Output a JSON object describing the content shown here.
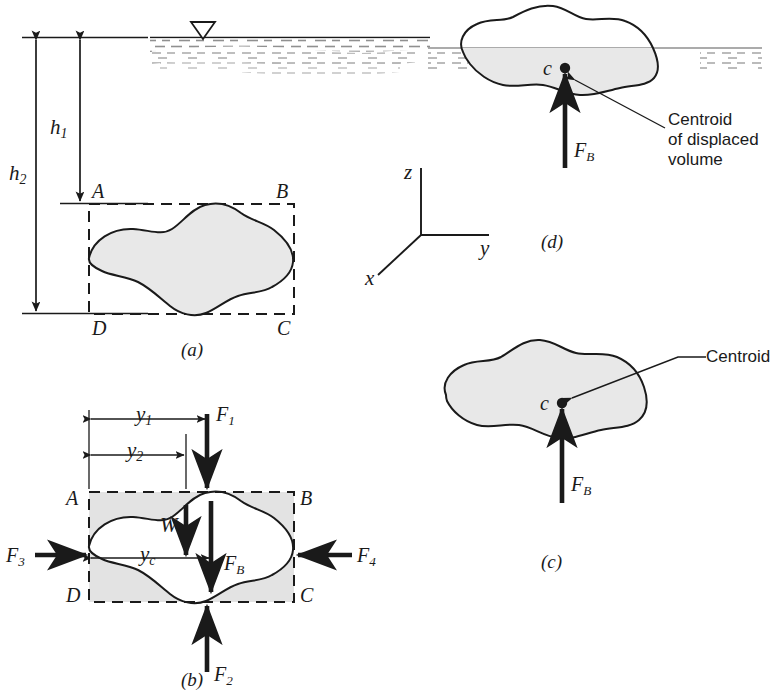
{
  "figure": {
    "colors": {
      "line": "#1a1a1a",
      "body_fill": "#e8e8e8",
      "shade_fill": "#e3e3e3",
      "water_hatch": "#7a7a7a",
      "white": "#ffffff"
    }
  },
  "panels": {
    "a": {
      "caption": "(a)",
      "corner_labels": {
        "A": "A",
        "B": "B",
        "C": "C",
        "D": "D"
      },
      "dimensions": [
        {
          "name": "h1",
          "base": "h",
          "sub": "1"
        },
        {
          "name": "h2",
          "base": "h",
          "sub": "2"
        }
      ],
      "free_surface_marker": "free-surface-triangle"
    },
    "b": {
      "caption": "(b)",
      "corner_labels": {
        "A": "A",
        "B": "B",
        "C": "C",
        "D": "D"
      },
      "dimensions": [
        {
          "name": "y1",
          "base": "y",
          "sub": "1"
        },
        {
          "name": "y2",
          "base": "y",
          "sub": "2"
        },
        {
          "name": "yc",
          "base": "y",
          "sub": "c"
        }
      ],
      "forces": [
        {
          "name": "F1",
          "base": "F",
          "sub": "1",
          "direction": "down"
        },
        {
          "name": "F2",
          "base": "F",
          "sub": "2",
          "direction": "up"
        },
        {
          "name": "F3",
          "base": "F",
          "sub": "3",
          "direction": "right"
        },
        {
          "name": "F4",
          "base": "F",
          "sub": "4",
          "direction": "left"
        },
        {
          "name": "FB",
          "base": "F",
          "sub": "B",
          "direction": "down"
        },
        {
          "name": "W",
          "base": "W",
          "sub": "",
          "direction": "down"
        }
      ]
    },
    "c": {
      "caption": "(c)",
      "centroid_label": "c",
      "annotation": "Centroid",
      "force": {
        "base": "F",
        "sub": "B",
        "direction": "up"
      }
    },
    "d": {
      "caption": "(d)",
      "centroid_label": "c",
      "annotation_lines": [
        "Centroid",
        "of displaced",
        "volume"
      ],
      "force": {
        "base": "F",
        "sub": "B",
        "direction": "up"
      }
    }
  },
  "axes": {
    "z": "z",
    "y": "y",
    "x": "x"
  }
}
